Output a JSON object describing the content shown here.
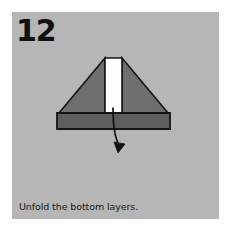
{
  "panel": {
    "background_color": "#b6b6b6",
    "page_background": "#ffffff"
  },
  "step": {
    "number": "12",
    "number_color": "#111111"
  },
  "caption": {
    "text": "Unfold the bottom layers.",
    "color": "#16161a"
  },
  "diagram": {
    "type": "origami-fold-step",
    "outline_color": "#161616",
    "shapes": [
      {
        "name": "upper-triangle-left",
        "fill": "#6f6f6f",
        "points": "47,101 93,46 93,101"
      },
      {
        "name": "upper-triangle-right",
        "fill": "#6f6f6f",
        "points": "110,46 156,101 110,101"
      },
      {
        "name": "white-center-strip",
        "fill": "#fdfdfd",
        "points": "93,46 110,46 110,101 93,101"
      },
      {
        "name": "base-band",
        "fill": "#5d5d5d",
        "points": "45,101 158,101 158,117 45,117"
      }
    ],
    "arrow": {
      "name": "unfold-arrow",
      "color": "#111111",
      "direction": "down",
      "path": "101,96 C 101,118 104,126 108,134",
      "head_at": "108,138"
    }
  }
}
